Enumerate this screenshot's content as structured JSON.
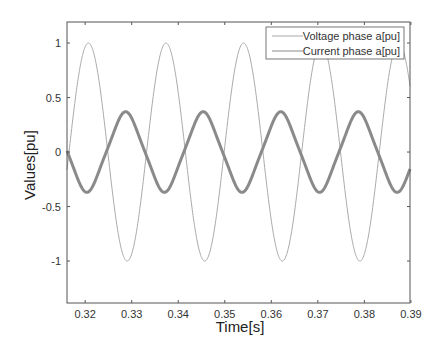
{
  "chart_data": {
    "type": "line",
    "title": "",
    "xlabel": "Time[s]",
    "ylabel": "Values[pu]",
    "xlim": [
      0.3161,
      0.3898
    ],
    "ylim": [
      -1.385,
      1.193
    ],
    "xticks": [
      0.32,
      0.33,
      0.34,
      0.35,
      0.36,
      0.37,
      0.38,
      0.39
    ],
    "xtick_labels": [
      "0.32",
      "0.33",
      "0.34",
      "0.35",
      "0.36",
      "0.37",
      "0.38",
      "0.39"
    ],
    "yticks": [
      1,
      0.5,
      0,
      -0.5,
      -1
    ],
    "ytick_labels": [
      "1",
      "0.5",
      "0",
      "-0.5",
      "-1"
    ],
    "grid": false,
    "legend_position": "top-right",
    "frequency_hz": 60,
    "series": [
      {
        "name": "Voltage phase a[pu]",
        "color": "#aaaaaa",
        "amplitude": 1.0,
        "peak_time": 0.3207,
        "description": "sinusoid, amplitude 1.0 pu, peaks at ~0.3207, 0.3374, 0.3541, 0.3707, 0.3874 s; troughs at ~0.3290, 0.3457, 0.3624, 0.3790 s"
      },
      {
        "name": "Current phase a[pu]",
        "color": "#8a8a8a",
        "amplitude": 0.35,
        "peak_time": 0.3287,
        "description": "noisy sinusoid, amplitude ~0.35 pu, roughly antiphase to voltage; peaks at ~0.3287, 0.3454, 0.3620, 0.3787 s; troughs at ~0.3204, 0.3370, 0.3537, 0.3704, 0.3870 s"
      }
    ]
  }
}
